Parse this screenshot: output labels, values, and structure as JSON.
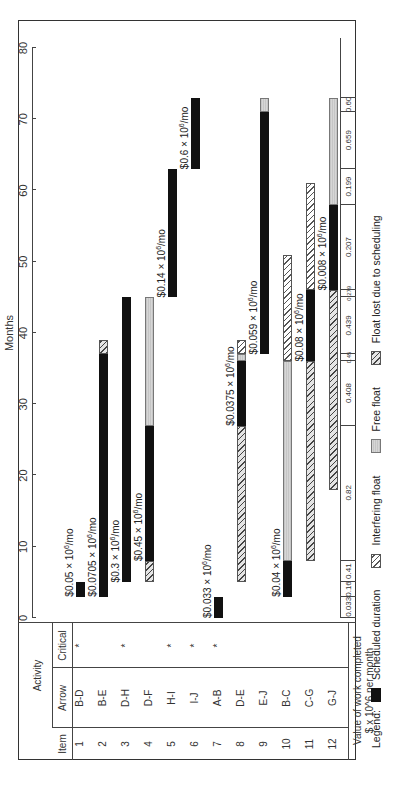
{
  "chart_data": {
    "type": "gantt",
    "title": "",
    "xlabel": "Months",
    "xlim": [
      0,
      80
    ],
    "x_ticks": [
      0,
      10,
      20,
      30,
      40,
      50,
      60,
      70,
      80
    ],
    "orientation": "rotated 90 degrees counter-clockwise",
    "table_headers": {
      "group": "Activity",
      "item": "Item",
      "arrow": "Arrow",
      "critical": "Critical"
    },
    "rows": [
      {
        "item": "1",
        "arrow": "B-D",
        "critical": true,
        "rate": "$0.05 x 10^6/mo",
        "segments": [
          {
            "type": "scheduled",
            "start": 3,
            "end": 5
          }
        ]
      },
      {
        "item": "2",
        "arrow": "B-E",
        "critical": false,
        "rate": "$0.0705 x 10^6/mo",
        "segments": [
          {
            "type": "scheduled",
            "start": 3,
            "end": 37
          },
          {
            "type": "float_lost",
            "start": 37,
            "end": 39
          }
        ]
      },
      {
        "item": "3",
        "arrow": "D-H",
        "critical": true,
        "rate": "$0.3 x 10^6/mo",
        "segments": [
          {
            "type": "scheduled",
            "start": 5,
            "end": 45
          }
        ]
      },
      {
        "item": "4",
        "arrow": "D-F",
        "critical": false,
        "rate": "$0.45 x 10^6/mo",
        "segments": [
          {
            "type": "float_lost",
            "start": 5,
            "end": 8
          },
          {
            "type": "scheduled",
            "start": 8,
            "end": 27
          },
          {
            "type": "free_float",
            "start": 27,
            "end": 45
          }
        ]
      },
      {
        "item": "5",
        "arrow": "H-I",
        "critical": true,
        "rate": "$0.14 x 10^6/mo",
        "segments": [
          {
            "type": "scheduled",
            "start": 45,
            "end": 63
          }
        ]
      },
      {
        "item": "6",
        "arrow": "I-J",
        "critical": true,
        "rate": "$0.6 x 10^6/mo",
        "segments": [
          {
            "type": "scheduled",
            "start": 63,
            "end": 73
          }
        ]
      },
      {
        "item": "7",
        "arrow": "A-B",
        "critical": true,
        "rate": "$0.033 x 10^6/mo",
        "segments": [
          {
            "type": "scheduled",
            "start": 0,
            "end": 3
          }
        ]
      },
      {
        "item": "8",
        "arrow": "D-E",
        "critical": false,
        "rate": "$0.0375 x 10^6/mo",
        "segments": [
          {
            "type": "float_lost",
            "start": 5,
            "end": 27
          },
          {
            "type": "scheduled",
            "start": 27,
            "end": 36
          },
          {
            "type": "free_float",
            "start": 36,
            "end": 37
          },
          {
            "type": "interfering_float",
            "start": 37,
            "end": 39
          }
        ]
      },
      {
        "item": "9",
        "arrow": "E-J",
        "critical": false,
        "rate": "$0.059 x 10^6/mo",
        "segments": [
          {
            "type": "scheduled",
            "start": 37,
            "end": 71
          },
          {
            "type": "free_float",
            "start": 71,
            "end": 73
          }
        ]
      },
      {
        "item": "10",
        "arrow": "B-C",
        "critical": false,
        "rate": "$0.04 x 10^6/mo",
        "segments": [
          {
            "type": "scheduled",
            "start": 3,
            "end": 8
          },
          {
            "type": "free_float",
            "start": 8,
            "end": 36
          },
          {
            "type": "interfering_float",
            "start": 36,
            "end": 51
          }
        ]
      },
      {
        "item": "11",
        "arrow": "C-G",
        "critical": false,
        "rate": "$0.08 x 10^6/mo",
        "segments": [
          {
            "type": "float_lost",
            "start": 8,
            "end": 36
          },
          {
            "type": "scheduled",
            "start": 36,
            "end": 46
          },
          {
            "type": "interfering_float",
            "start": 46,
            "end": 61
          }
        ]
      },
      {
        "item": "12",
        "arrow": "G-J",
        "critical": false,
        "rate": "$0.008 x 10^6/mo",
        "segments": [
          {
            "type": "float_lost",
            "start": 18,
            "end": 46
          },
          {
            "type": "scheduled",
            "start": 46,
            "end": 58
          },
          {
            "type": "free_float",
            "start": 58,
            "end": 73
          }
        ]
      }
    ],
    "value_strip": {
      "label_line1": "Value of work completed",
      "label_line2": "$ x 10^6 per month",
      "cells": [
        {
          "start": 0,
          "end": 3,
          "value": "0.033"
        },
        {
          "start": 3,
          "end": 5,
          "value": "0.16"
        },
        {
          "start": 5,
          "end": 8,
          "value": "0.41"
        },
        {
          "start": 8,
          "end": 27,
          "value": "0.82"
        },
        {
          "start": 27,
          "end": 36,
          "value": "0.408"
        },
        {
          "start": 36,
          "end": 37,
          "value": "0.45"
        },
        {
          "start": 37,
          "end": 45,
          "value": "0.439"
        },
        {
          "start": 45,
          "end": 46,
          "value": "0.279"
        },
        {
          "start": 46,
          "end": 58,
          "value": "0.207"
        },
        {
          "start": 58,
          "end": 63,
          "value": "0.199"
        },
        {
          "start": 63,
          "end": 71,
          "value": "0.659"
        },
        {
          "start": 71,
          "end": 73,
          "value": "0.60"
        }
      ]
    },
    "legend": {
      "title": "Legend:",
      "entries": [
        {
          "key": "scheduled",
          "label": "Scheduled duration"
        },
        {
          "key": "interfering_float",
          "label": "Interfering float"
        },
        {
          "key": "free_float",
          "label": "Free float"
        },
        {
          "key": "float_lost",
          "label": "Float lost due to scheduling"
        }
      ]
    },
    "critical_marker": "*"
  }
}
